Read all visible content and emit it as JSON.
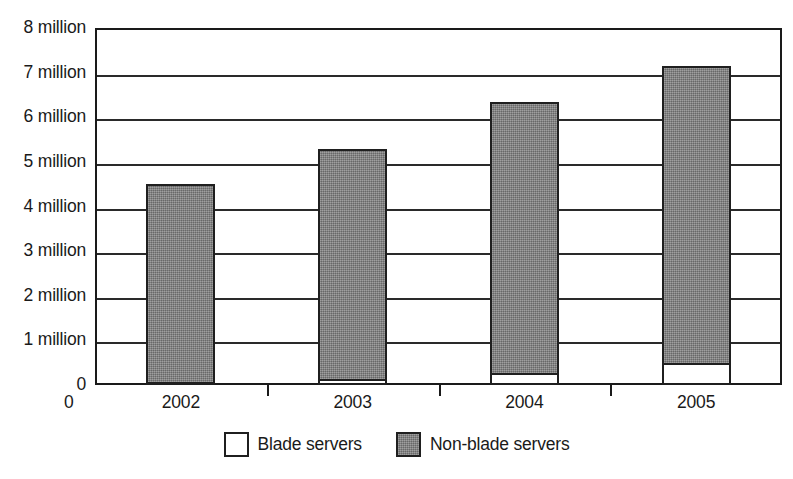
{
  "chart_data": {
    "type": "bar",
    "subtype": "stacked-bar",
    "title": "",
    "subtitle": "",
    "xlabel": "",
    "ylabel": "",
    "categories": [
      "2002",
      "2003",
      "2004",
      "2005"
    ],
    "series": [
      {
        "name": "Blade servers",
        "values": [
          0.07,
          0.13,
          0.27,
          0.5
        ],
        "color": "#ffffff",
        "swatch": "white-square"
      },
      {
        "name": "Non-blade servers",
        "values": [
          4.43,
          5.17,
          6.08,
          6.65
        ],
        "color": "#818181",
        "swatch": "gray-square"
      }
    ],
    "totals": [
      4.5,
      5.3,
      6.35,
      7.15
    ],
    "ylim": [
      0,
      8
    ],
    "ytick_values": [
      0,
      1,
      2,
      3,
      4,
      5,
      6,
      7,
      8
    ],
    "ytick_labels": [
      "0",
      "1 million",
      "2 million",
      "3 million",
      "4 million",
      "5 million",
      "6 million",
      "7 million",
      "8 million"
    ],
    "x_origin_label": "0",
    "grid": true,
    "grid_axis": "y",
    "legend_position": "bottom-center",
    "units": "units shipped (millions)",
    "border_color": "#1a1a1a",
    "background": "#ffffff"
  },
  "legend": {
    "items": [
      {
        "label": "Blade servers",
        "swatch": "white-square"
      },
      {
        "label": "Non-blade servers",
        "swatch": "gray-square"
      }
    ]
  }
}
